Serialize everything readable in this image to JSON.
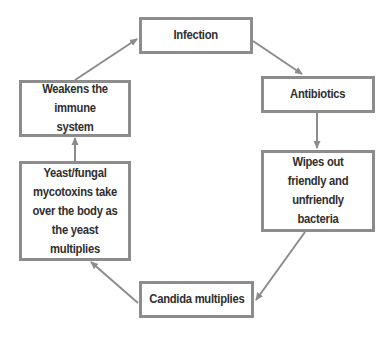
{
  "diagram": {
    "type": "cycle-flowchart",
    "title_partial": "",
    "colors": {
      "border": "#8c8c8c",
      "arrow": "#8c8c8c",
      "text": "#2f2f2f",
      "background": "#ffffff"
    },
    "nodes": [
      {
        "id": "infection",
        "label": "Infection"
      },
      {
        "id": "antibiotics",
        "label": "Antibiotics"
      },
      {
        "id": "wipes",
        "label": "Wipes out friendly and unfriendly bacteria"
      },
      {
        "id": "candida",
        "label": "Candida multiplies"
      },
      {
        "id": "yeast",
        "label": "Yeast/fungal mycotoxins take over the body as the yeast multiplies"
      },
      {
        "id": "weakens",
        "label": "Weakens the immune system"
      }
    ],
    "edges": [
      {
        "from": "infection",
        "to": "antibiotics"
      },
      {
        "from": "antibiotics",
        "to": "wipes"
      },
      {
        "from": "wipes",
        "to": "candida"
      },
      {
        "from": "candida",
        "to": "yeast"
      },
      {
        "from": "yeast",
        "to": "weakens"
      },
      {
        "from": "weakens",
        "to": "infection"
      }
    ]
  }
}
